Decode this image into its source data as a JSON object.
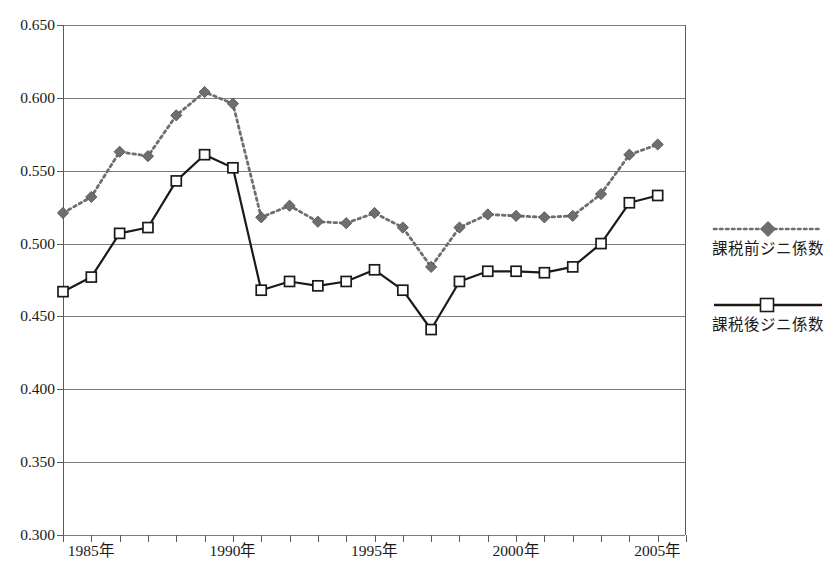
{
  "chart_data": {
    "type": "line",
    "title": "",
    "subtitle": "",
    "xlabel": "",
    "ylabel": "",
    "grid": true,
    "legend_position": "right",
    "xlim": [
      1984,
      2006
    ],
    "ylim": [
      0.3,
      0.65
    ],
    "x": [
      1984,
      1985,
      1986,
      1987,
      1988,
      1989,
      1990,
      1991,
      1992,
      1993,
      1994,
      1995,
      1996,
      1997,
      1998,
      1999,
      2000,
      2001,
      2002,
      2003,
      2004,
      2005,
      2006
    ],
    "xtick_labels": [
      "1985年",
      "1990年",
      "1995年",
      "2000年",
      "2005年"
    ],
    "xtick_values": [
      1985,
      1990,
      1995,
      2000,
      2005
    ],
    "ytick_labels": [
      "0.300",
      "0.350",
      "0.400",
      "0.450",
      "0.500",
      "0.550",
      "0.600",
      "0.650"
    ],
    "ytick_values": [
      0.3,
      0.35,
      0.4,
      0.45,
      0.5,
      0.55,
      0.6,
      0.65
    ],
    "series": [
      {
        "name": "課税前ジニ係数",
        "marker": "filled-diamond",
        "line_style": "dotted",
        "color": "#6e6e6e",
        "values": [
          0.521,
          0.532,
          0.563,
          0.56,
          0.588,
          0.604,
          0.596,
          0.518,
          0.526,
          0.515,
          0.514,
          0.521,
          0.511,
          0.484,
          0.511,
          0.52,
          0.519,
          0.518,
          0.519,
          0.534,
          0.561,
          0.568,
          null
        ]
      },
      {
        "name": "課税後ジニ係数",
        "marker": "open-square",
        "line_style": "solid",
        "color": "#1a1a1a",
        "values": [
          0.467,
          0.477,
          0.507,
          0.511,
          0.543,
          0.561,
          0.552,
          0.468,
          0.474,
          0.471,
          0.474,
          0.482,
          0.468,
          0.441,
          0.474,
          0.481,
          0.481,
          0.48,
          0.484,
          0.5,
          0.528,
          0.533,
          null
        ]
      }
    ]
  },
  "legend": {
    "entries": [
      {
        "label": "課税前ジニ係数",
        "swatch": "dotted-diamond-swatch"
      },
      {
        "label": "課税後ジニ係数",
        "swatch": "solid-square-swatch"
      }
    ]
  }
}
